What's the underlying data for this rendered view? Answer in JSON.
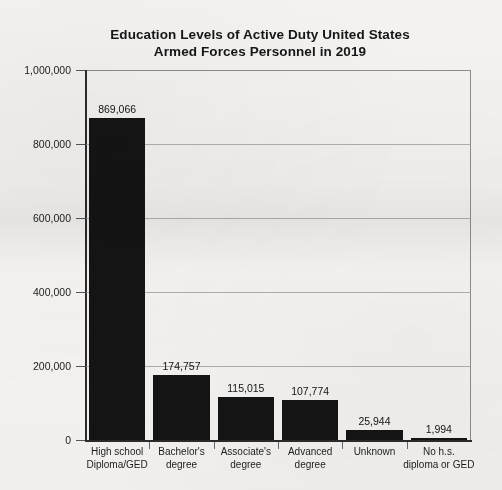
{
  "chart_data": {
    "type": "bar",
    "title": "Education Levels of Active Duty United States Armed Forces Personnel in 2019",
    "title_lines": [
      "Education Levels of Active Duty United States",
      "Armed Forces Personnel in 2019"
    ],
    "xlabel": "",
    "ylabel": "",
    "ylim": [
      0,
      1000000
    ],
    "grid": true,
    "legend": false,
    "bar_color": "#141414",
    "categories": [
      "High school Diploma/GED",
      "Bachelor's degree",
      "Associate's degree",
      "Advanced degree",
      "Unknown",
      "No h.s. diploma or GED"
    ],
    "category_label_lines": [
      [
        "High school",
        "Diploma/GED"
      ],
      [
        "Bachelor's",
        "degree"
      ],
      [
        "Associate's",
        "degree"
      ],
      [
        "Advanced",
        "degree"
      ],
      [
        "Unknown",
        ""
      ],
      [
        "No h.s.",
        "diploma or GED"
      ]
    ],
    "values": [
      869066,
      174757,
      115015,
      107774,
      25944,
      1994
    ],
    "value_labels": [
      "869,066",
      "174,757",
      "115,015",
      "107,774",
      "25,944",
      "1,994"
    ],
    "ytick_values": [
      0,
      200000,
      400000,
      600000,
      800000,
      1000000
    ],
    "ytick_labels": [
      "0",
      "200,000",
      "400,000",
      "600,000",
      "800,000",
      "1,000,000"
    ]
  }
}
